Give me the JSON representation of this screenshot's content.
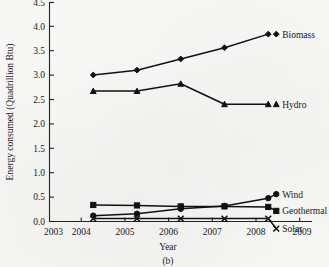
{
  "chart_data": {
    "type": "line",
    "title": "",
    "caption": "(b)",
    "xlabel": "Year",
    "ylabel": "Energy consumed (Quadrillion Btu)",
    "x": [
      2004,
      2005,
      2006,
      2007,
      2008
    ],
    "xlim": [
      2003,
      2009
    ],
    "ylim": [
      0.0,
      4.5
    ],
    "grid": false,
    "legend_position": "right-inline",
    "xticks": [
      "2003",
      "2004",
      "2005",
      "2006",
      "2007",
      "2008",
      "2009"
    ],
    "yticks": [
      "0.0",
      "0.5",
      "1.0",
      "1.5",
      "2.0",
      "2.5",
      "3.0",
      "3.5",
      "4.0",
      "4.5"
    ],
    "series": [
      {
        "name": "Biomass",
        "marker": "diamond",
        "values": [
          3.01,
          3.11,
          3.34,
          3.57,
          3.85
        ]
      },
      {
        "name": "Hydro",
        "marker": "triangle",
        "values": [
          2.68,
          2.68,
          2.83,
          2.41,
          2.41
        ]
      },
      {
        "name": "Wind",
        "marker": "circle",
        "values": [
          0.12,
          0.16,
          0.26,
          0.32,
          0.48
        ]
      },
      {
        "name": "Geothermal",
        "marker": "square",
        "values": [
          0.34,
          0.33,
          0.31,
          0.31,
          0.3
        ]
      },
      {
        "name": "Solar",
        "marker": "x",
        "values": [
          0.06,
          0.06,
          0.06,
          0.06,
          0.06
        ]
      }
    ]
  },
  "colors": {
    "ink": "#111111",
    "axis": "#222222",
    "paper": "#f7f7f5"
  }
}
